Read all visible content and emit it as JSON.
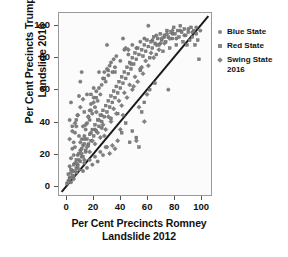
{
  "chart_data": {
    "type": "scatter",
    "title": "",
    "xlabel": "Per Cent Precincts Romney\nLandslide 2012",
    "ylabel": "Per Cent Precincts Trump\nLandslide 2016",
    "xlabel_line1": "Per Cent Precincts Romney",
    "xlabel_line2": "Landslide 2012",
    "ylabel_line1": "Per Cent Precincts Trump",
    "ylabel_line2": "Landslide 2016",
    "xlim": [
      -6,
      108
    ],
    "ylim": [
      -6,
      108
    ],
    "xticks": [
      0,
      20,
      40,
      60,
      80,
      100
    ],
    "yticks": [
      0,
      20,
      40,
      60,
      80,
      100
    ],
    "xtick_labels": [
      "0",
      "20",
      "40",
      "60",
      "80",
      "100"
    ],
    "ytick_labels": [
      "0",
      "20",
      "40",
      "60",
      "80",
      "100"
    ],
    "grid": false,
    "legend_position": "right",
    "reference_line": {
      "label": "y = x",
      "from": [
        -4,
        -4
      ],
      "to": [
        106,
        106
      ],
      "color": "#1a1a1a",
      "width": 2
    },
    "marker_color": "#808080",
    "marker_edge_color": "#5f5f5f",
    "series": [
      {
        "name": "Blue State",
        "marker": "circle",
        "color": "#808080",
        "points": [
          [
            1,
            3
          ],
          [
            2,
            5
          ],
          [
            3,
            2
          ],
          [
            4,
            9
          ],
          [
            5,
            6
          ],
          [
            2,
            12
          ],
          [
            6,
            14
          ],
          [
            3,
            17
          ],
          [
            7,
            11
          ],
          [
            8,
            19
          ],
          [
            4,
            23
          ],
          [
            9,
            16
          ],
          [
            5,
            27
          ],
          [
            10,
            22
          ],
          [
            11,
            29
          ],
          [
            6,
            33
          ],
          [
            12,
            25
          ],
          [
            13,
            31
          ],
          [
            7,
            37
          ],
          [
            14,
            35
          ],
          [
            2,
            41
          ],
          [
            8,
            44
          ],
          [
            15,
            39
          ],
          [
            16,
            43
          ],
          [
            3,
            52
          ],
          [
            17,
            47
          ],
          [
            9,
            56
          ],
          [
            18,
            51
          ],
          [
            19,
            45
          ],
          [
            10,
            65
          ],
          [
            20,
            55
          ],
          [
            21,
            49
          ],
          [
            11,
            71
          ],
          [
            22,
            59
          ],
          [
            23,
            53
          ],
          [
            24,
            61
          ],
          [
            25,
            57
          ],
          [
            26,
            63
          ],
          [
            12,
            37
          ],
          [
            27,
            67
          ],
          [
            28,
            71
          ],
          [
            29,
            65
          ],
          [
            30,
            73
          ],
          [
            31,
            69
          ],
          [
            32,
            75
          ],
          [
            13,
            29
          ],
          [
            33,
            77
          ],
          [
            34,
            71
          ],
          [
            35,
            79
          ],
          [
            36,
            74
          ],
          [
            5,
            19
          ],
          [
            6,
            24
          ],
          [
            7,
            8
          ],
          [
            8,
            13
          ],
          [
            9,
            31
          ],
          [
            10,
            27
          ],
          [
            11,
            18
          ],
          [
            14,
            21
          ],
          [
            16,
            26
          ],
          [
            18,
            33
          ],
          [
            37,
            81
          ],
          [
            40,
            78
          ],
          [
            43,
            85
          ],
          [
            46,
            82
          ],
          [
            49,
            88
          ],
          [
            52,
            86
          ],
          [
            55,
            90
          ],
          [
            58,
            92
          ],
          [
            61,
            100
          ],
          [
            64,
            91
          ],
          [
            67,
            94
          ],
          [
            70,
            89
          ],
          [
            73,
            93
          ],
          [
            76,
            60
          ],
          [
            79,
            95
          ],
          [
            82,
            92
          ],
          [
            85,
            97
          ],
          [
            88,
            94
          ],
          [
            91,
            98
          ],
          [
            94,
            96
          ],
          [
            97,
            99
          ],
          [
            100,
            97
          ],
          [
            30,
            88
          ],
          [
            42,
            92
          ],
          [
            24,
            71
          ],
          [
            20,
            61
          ],
          [
            15,
            57
          ],
          [
            17,
            41
          ],
          [
            21,
            35
          ],
          [
            26,
            44
          ],
          [
            12,
            9
          ],
          [
            13,
            14
          ],
          [
            15,
            11
          ],
          [
            17,
            16
          ],
          [
            19,
            13
          ],
          [
            21,
            18
          ],
          [
            23,
            15
          ],
          [
            25,
            21
          ],
          [
            27,
            19
          ],
          [
            29,
            24
          ]
        ]
      },
      {
        "name": "Red State",
        "marker": "square",
        "color": "#808080",
        "points": [
          [
            0,
            1
          ],
          [
            1,
            7
          ],
          [
            2,
            4
          ],
          [
            3,
            10
          ],
          [
            4,
            6
          ],
          [
            5,
            13
          ],
          [
            6,
            9
          ],
          [
            7,
            16
          ],
          [
            8,
            12
          ],
          [
            9,
            20
          ],
          [
            10,
            15
          ],
          [
            11,
            23
          ],
          [
            12,
            18
          ],
          [
            13,
            26
          ],
          [
            14,
            22
          ],
          [
            15,
            29
          ],
          [
            16,
            25
          ],
          [
            17,
            32
          ],
          [
            18,
            28
          ],
          [
            19,
            35
          ],
          [
            20,
            31
          ],
          [
            21,
            38
          ],
          [
            22,
            34
          ],
          [
            23,
            41
          ],
          [
            24,
            37
          ],
          [
            25,
            44
          ],
          [
            26,
            40
          ],
          [
            27,
            47
          ],
          [
            28,
            43
          ],
          [
            29,
            50
          ],
          [
            30,
            46
          ],
          [
            31,
            53
          ],
          [
            32,
            49
          ],
          [
            33,
            56
          ],
          [
            34,
            52
          ],
          [
            35,
            59
          ],
          [
            36,
            55
          ],
          [
            37,
            62
          ],
          [
            38,
            58
          ],
          [
            39,
            65
          ],
          [
            40,
            61
          ],
          [
            41,
            68
          ],
          [
            42,
            64
          ],
          [
            43,
            71
          ],
          [
            44,
            67
          ],
          [
            45,
            74
          ],
          [
            46,
            70
          ],
          [
            47,
            77
          ],
          [
            48,
            73
          ],
          [
            49,
            80
          ],
          [
            50,
            76
          ],
          [
            51,
            83
          ],
          [
            52,
            79
          ],
          [
            53,
            86
          ],
          [
            54,
            82
          ],
          [
            55,
            72
          ],
          [
            56,
            85
          ],
          [
            57,
            81
          ],
          [
            58,
            88
          ],
          [
            59,
            84
          ],
          [
            60,
            91
          ],
          [
            61,
            87
          ],
          [
            62,
            80
          ],
          [
            63,
            90
          ],
          [
            64,
            86
          ],
          [
            65,
            93
          ],
          [
            66,
            89
          ],
          [
            67,
            82
          ],
          [
            68,
            92
          ],
          [
            69,
            88
          ],
          [
            70,
            95
          ],
          [
            71,
            91
          ],
          [
            72,
            84
          ],
          [
            73,
            94
          ],
          [
            74,
            90
          ],
          [
            75,
            97
          ],
          [
            76,
            93
          ],
          [
            77,
            86
          ],
          [
            78,
            96
          ],
          [
            79,
            92
          ],
          [
            80,
            99
          ],
          [
            81,
            95
          ],
          [
            82,
            88
          ],
          [
            83,
            97
          ],
          [
            84,
            93
          ],
          [
            85,
            100
          ],
          [
            86,
            96
          ],
          [
            87,
            90
          ],
          [
            88,
            98
          ],
          [
            89,
            94
          ],
          [
            90,
            88
          ],
          [
            91,
            96
          ],
          [
            92,
            91
          ],
          [
            93,
            99
          ],
          [
            94,
            93
          ],
          [
            95,
            97
          ],
          [
            96,
            88
          ],
          [
            97,
            95
          ],
          [
            98,
            91
          ],
          [
            99,
            79
          ],
          [
            4,
            37
          ],
          [
            7,
            41
          ],
          [
            13,
            46
          ],
          [
            18,
            57
          ],
          [
            22,
            55
          ],
          [
            28,
            67
          ],
          [
            31,
            72
          ],
          [
            36,
            71
          ],
          [
            38,
            45
          ],
          [
            44,
            39
          ],
          [
            47,
            27
          ],
          [
            52,
            30
          ],
          [
            56,
            46
          ],
          [
            58,
            52
          ],
          [
            62,
            60
          ],
          [
            66,
            64
          ],
          [
            54,
            24
          ],
          [
            49,
            34
          ],
          [
            41,
            33
          ],
          [
            33,
            42
          ]
        ]
      },
      {
        "name": "Swing State 2016",
        "marker": "diamond",
        "color": "#808080",
        "points": [
          [
            1,
            2
          ],
          [
            3,
            8
          ],
          [
            5,
            4
          ],
          [
            7,
            14
          ],
          [
            9,
            10
          ],
          [
            11,
            20
          ],
          [
            13,
            16
          ],
          [
            15,
            24
          ],
          [
            17,
            21
          ],
          [
            19,
            28
          ],
          [
            21,
            26
          ],
          [
            23,
            33
          ],
          [
            25,
            30
          ],
          [
            27,
            38
          ],
          [
            29,
            35
          ],
          [
            31,
            43
          ],
          [
            33,
            40
          ],
          [
            35,
            48
          ],
          [
            37,
            45
          ],
          [
            39,
            53
          ],
          [
            41,
            50
          ],
          [
            43,
            58
          ],
          [
            45,
            55
          ],
          [
            47,
            63
          ],
          [
            49,
            60
          ],
          [
            51,
            68
          ],
          [
            53,
            65
          ],
          [
            55,
            73
          ],
          [
            57,
            70
          ],
          [
            59,
            78
          ],
          [
            61,
            75
          ],
          [
            63,
            83
          ],
          [
            65,
            80
          ],
          [
            67,
            88
          ],
          [
            69,
            85
          ],
          [
            71,
            92
          ],
          [
            73,
            89
          ],
          [
            75,
            95
          ],
          [
            77,
            92
          ],
          [
            79,
            97
          ],
          [
            2,
            29
          ],
          [
            4,
            34
          ],
          [
            6,
            39
          ],
          [
            8,
            44
          ],
          [
            10,
            49
          ],
          [
            12,
            54
          ],
          [
            14,
            38
          ],
          [
            16,
            43
          ],
          [
            18,
            47
          ],
          [
            20,
            52
          ],
          [
            22,
            46
          ],
          [
            24,
            41
          ],
          [
            26,
            36
          ],
          [
            28,
            31
          ],
          [
            30,
            24
          ],
          [
            32,
            20
          ],
          [
            34,
            25
          ],
          [
            36,
            23
          ],
          [
            38,
            28
          ],
          [
            40,
            35
          ],
          [
            42,
            44
          ],
          [
            44,
            86
          ],
          [
            46,
            85
          ],
          [
            48,
            76
          ],
          [
            50,
            62
          ],
          [
            52,
            28
          ],
          [
            54,
            49
          ],
          [
            56,
            74
          ],
          [
            58,
            40
          ],
          [
            60,
            57
          ]
        ]
      }
    ]
  },
  "legend": {
    "items": [
      {
        "label": "Blue State",
        "marker": "circle"
      },
      {
        "label": "Red State",
        "marker": "square"
      },
      {
        "label": "Swing State\n2016",
        "marker": "diamond"
      }
    ]
  }
}
